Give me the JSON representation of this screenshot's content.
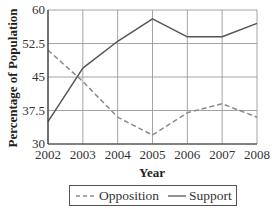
{
  "chart_data": {
    "type": "line",
    "title": "",
    "xlabel": "Year",
    "ylabel": "Percentage of Population",
    "x": [
      2002,
      2003,
      2004,
      2005,
      2006,
      2007,
      2008
    ],
    "x_tick_labels": [
      "2002",
      "2003",
      "2004",
      "2005",
      "2006",
      "2007",
      "2008"
    ],
    "y_ticks": [
      30,
      37.5,
      45,
      52.5,
      60
    ],
    "y_tick_labels": [
      "30",
      "37.5",
      "45",
      "52.5",
      "60"
    ],
    "ylim": [
      30,
      60
    ],
    "grid": true,
    "legend_position": "bottom",
    "series": [
      {
        "name": "Opposition",
        "style": "dashed",
        "color": "#8a8a8a",
        "values": [
          51,
          44,
          36,
          32,
          37,
          39,
          36
        ]
      },
      {
        "name": "Support",
        "style": "solid",
        "color": "#555555",
        "values": [
          35,
          47,
          53,
          58,
          54,
          54,
          57
        ]
      }
    ]
  },
  "colors": {
    "grid": "#9a9a9a",
    "axis": "#333333",
    "legend_border": "#555555"
  }
}
